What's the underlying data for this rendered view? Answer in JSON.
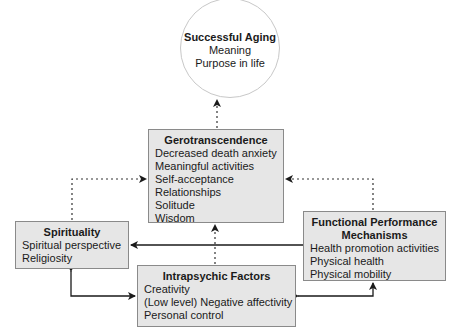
{
  "diagram": {
    "goal": {
      "title": "Successful Aging",
      "items": [
        "Meaning",
        "Purpose in life"
      ]
    },
    "gerotranscendence": {
      "title": "Gerotranscendence",
      "items": [
        "Decreased death anxiety",
        "Meaningful activities",
        "Self-acceptance",
        "Relationships",
        "Solitude",
        "Wisdom"
      ]
    },
    "spirituality": {
      "title": "Spirituality",
      "items": [
        "Spiritual perspective",
        "Religiosity"
      ]
    },
    "functional": {
      "title_line1": "Functional Performance",
      "title_line2": "Mechanisms",
      "items": [
        "Health promotion activities",
        "Physical health",
        "Physical mobility"
      ]
    },
    "intrapsychic": {
      "title": "Intrapsychic Factors",
      "items": [
        "Creativity",
        "(Low level) Negative affectivity",
        "Personal control"
      ]
    },
    "edges": [
      {
        "from": "Gerotranscendence",
        "to": "Successful Aging",
        "style": "dotted"
      },
      {
        "from": "Spirituality",
        "to": "Gerotranscendence",
        "style": "dotted"
      },
      {
        "from": "Functional Performance Mechanisms",
        "to": "Gerotranscendence",
        "style": "dotted"
      },
      {
        "from": "Intrapsychic Factors",
        "to": "Gerotranscendence",
        "style": "dotted"
      },
      {
        "from": "Functional Performance Mechanisms",
        "to": "Spirituality",
        "style": "solid"
      },
      {
        "from": "Spirituality",
        "to": "Intrapsychic Factors",
        "style": "solid",
        "bidirectional": true
      },
      {
        "from": "Intrapsychic Factors",
        "to": "Functional Performance Mechanisms",
        "style": "solid",
        "bidirectional": true
      }
    ]
  },
  "colors": {
    "box_fill": "#e6e6e6",
    "box_border": "#8a8a8a",
    "arrow": "#1a1a1a"
  }
}
